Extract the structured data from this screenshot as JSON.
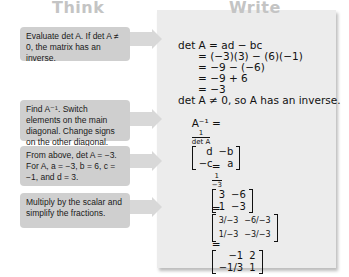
{
  "headers": {
    "think": "Think",
    "write": "Write"
  },
  "think_steps": [
    "Evaluate det A. If det A ≠ 0, the matrix has an inverse.",
    "Find A⁻¹. Switch elements on the main diagonal. Change signs on the other diagonal.",
    "From above, det A = −3. For A, a = −3, b = 6, c = −1, and d = 3.",
    "Multiply by the scalar and simplify the fractions."
  ],
  "write": {
    "det_lines": [
      "det A = ad − bc",
      "      = (−3)(3) − (6)(−1)",
      "      = −9 − (−6)",
      "      = −9 + 6",
      "      = −3"
    ],
    "conclusion": "det A ≠ 0, so A has an inverse.",
    "inverse_formula": {
      "lhs": "A⁻¹ =",
      "num": "1",
      "den": "det A",
      "matrix": [
        [
          "d",
          "−b"
        ],
        [
          "−c",
          "a"
        ]
      ]
    },
    "substituted": {
      "num": "1",
      "den": "−3",
      "matrix": [
        [
          "3",
          "−6"
        ],
        [
          "1",
          "−3"
        ]
      ]
    },
    "scaled": {
      "matrix": [
        [
          "3/−3",
          "−6/−3"
        ],
        [
          "1/−3",
          "−3/−3"
        ]
      ]
    },
    "result": {
      "matrix": [
        [
          "−1",
          "2"
        ],
        [
          "−1/3",
          "1"
        ]
      ]
    }
  },
  "equals": "="
}
